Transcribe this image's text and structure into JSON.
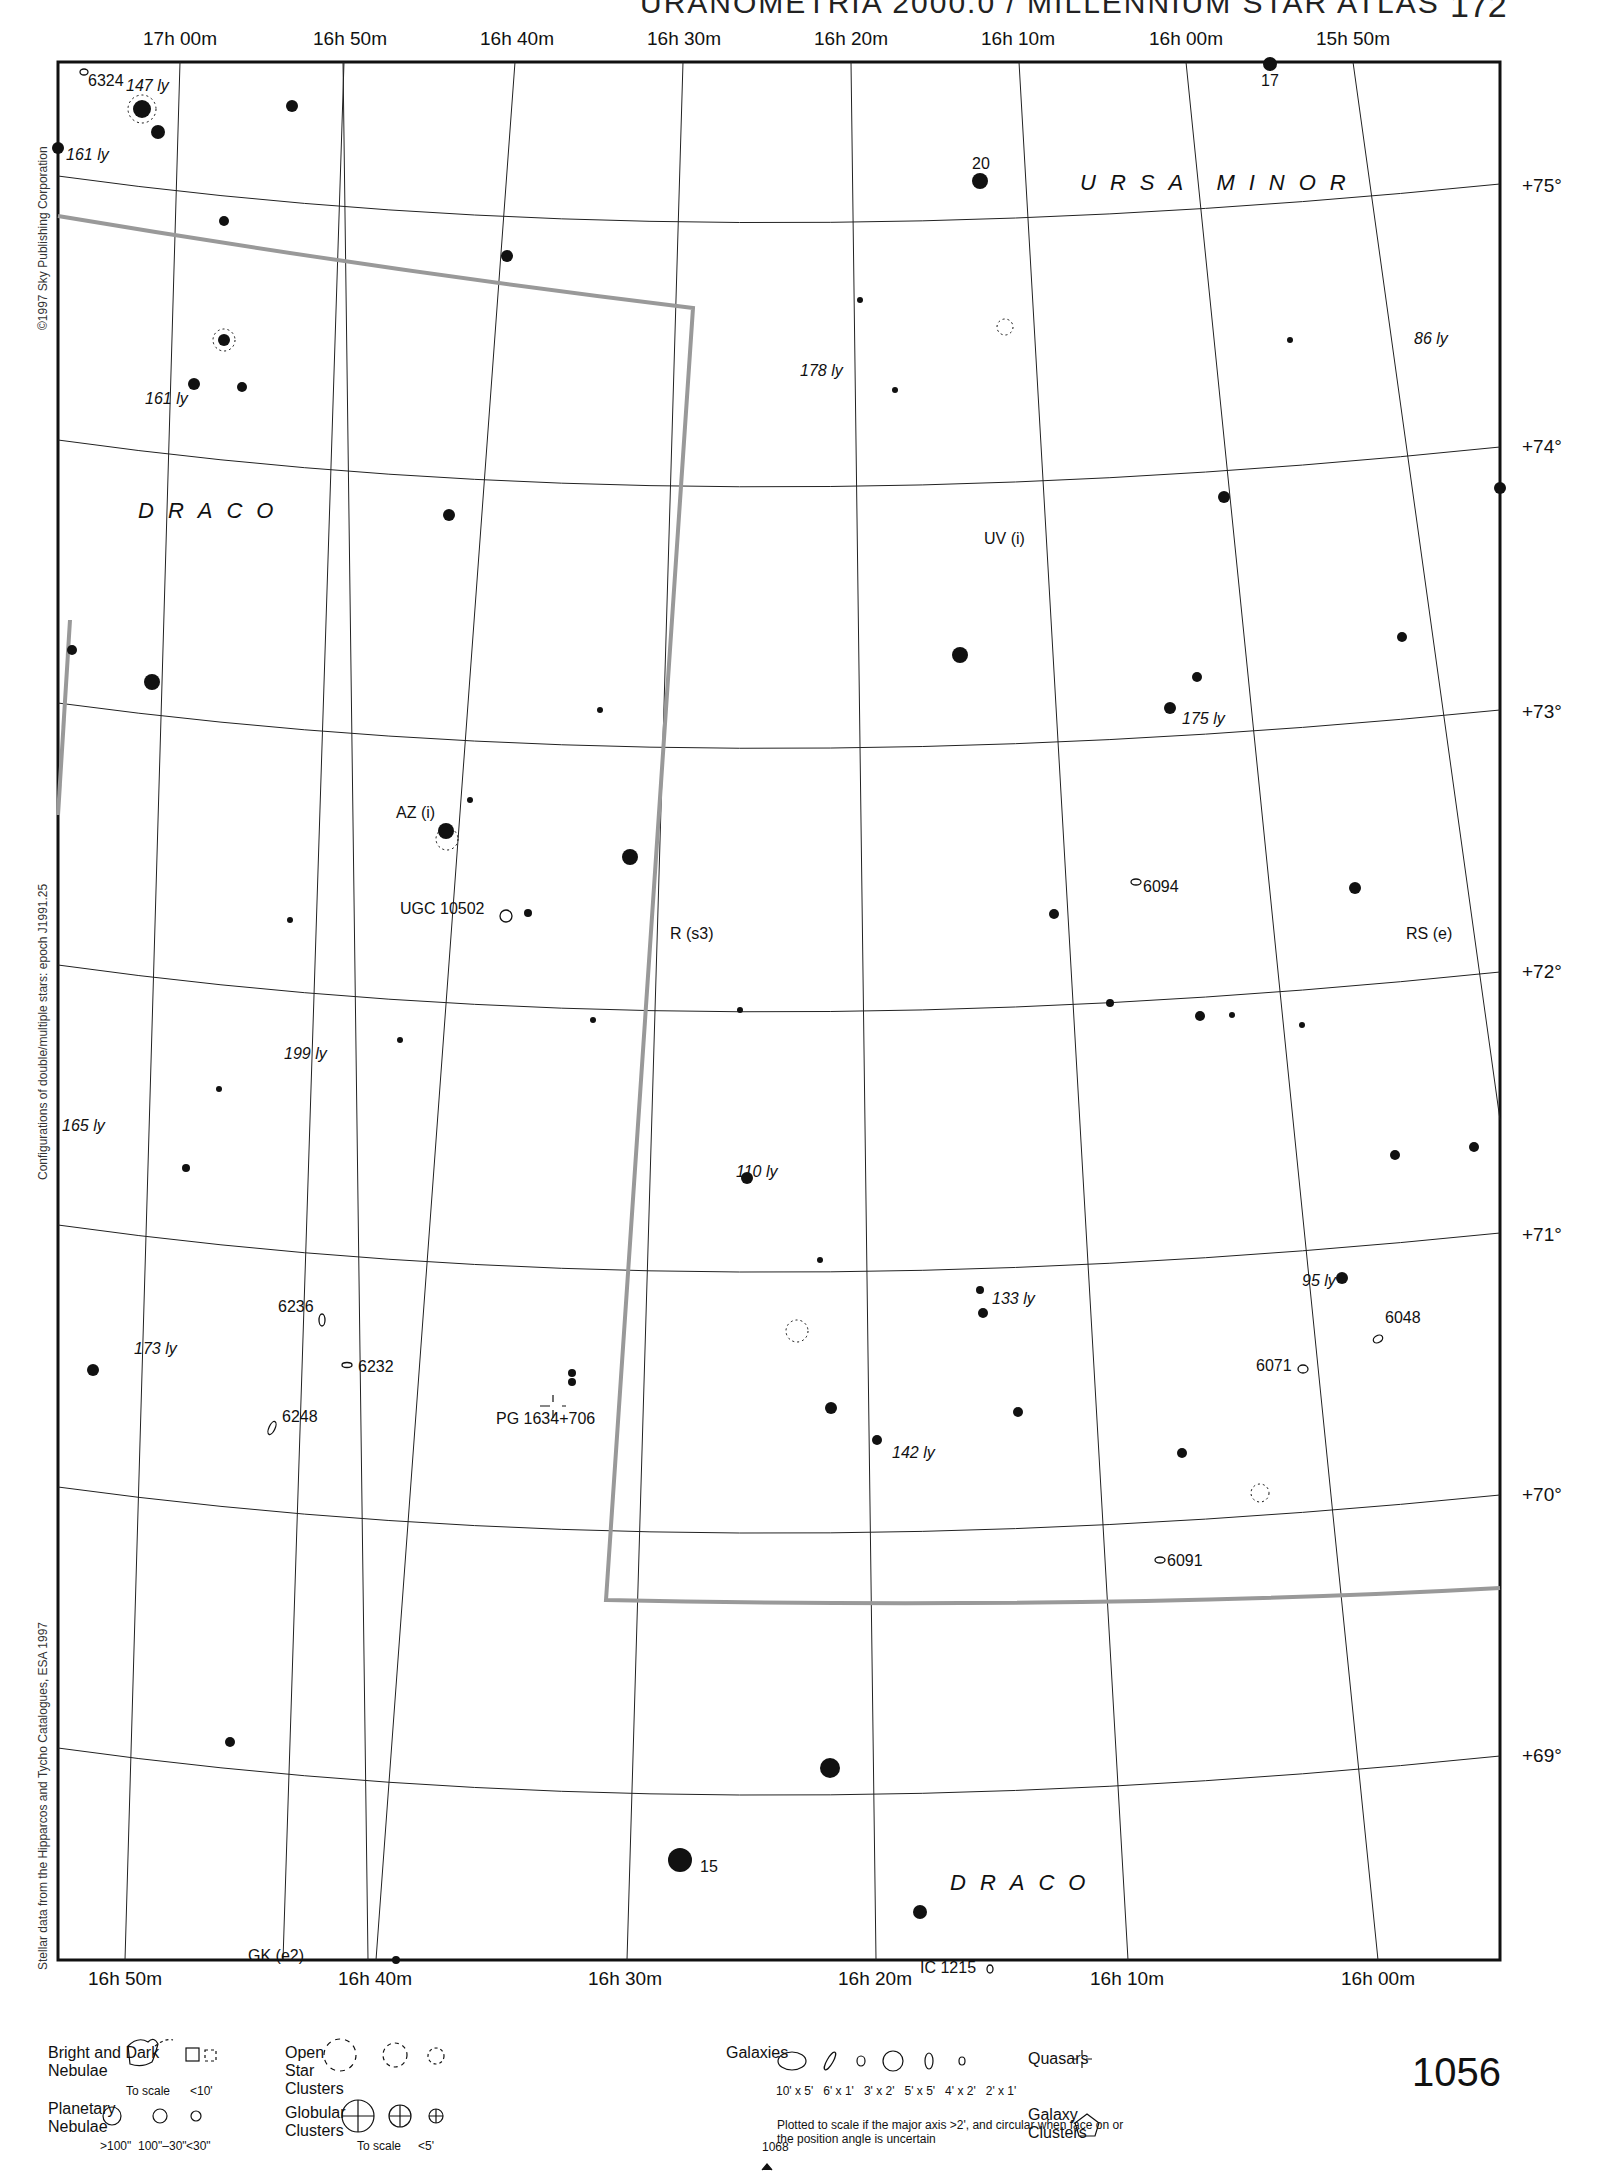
{
  "header": {
    "title": "URANOMETRIA 2000.0 / MILLENNIUM STAR ATLAS",
    "page_number": "172"
  },
  "side_texts": [
    "©1997 Sky Publishing Corporation",
    "Configurations of double/multiple stars: epoch J1991.25",
    "Stellar data from the Hipparcos and Tycho Catalogues, ESA 1997"
  ],
  "axes": {
    "ra_top": [
      "17h 00m",
      "16h 50m",
      "16h 40m",
      "16h 30m",
      "16h 20m",
      "16h 10m",
      "16h 00m",
      "15h 50m"
    ],
    "ra_bottom": [
      "16h 50m",
      "16h 40m",
      "16h 30m",
      "16h 20m",
      "16h 10m",
      "16h 00m"
    ],
    "dec_right": [
      "+75°",
      "+74°",
      "+73°",
      "+72°",
      "+71°",
      "+70°",
      "+69°"
    ]
  },
  "constellations": [
    "URSA MINOR",
    "DRACO",
    "DRACO"
  ],
  "labels": {
    "star_17": "17",
    "star_20": "20",
    "star_15": "15",
    "ngc_6324": "6324",
    "ly_147": "147 ly",
    "ly_161a": "161 ly",
    "ly_161b": "161 ly",
    "ly_178": "178 ly",
    "ly_86": "86 ly",
    "uv": "UV (i)",
    "ly_175": "175 ly",
    "az": "AZ (i)",
    "ugc": "UGC 10502",
    "r_s3": "R (s3)",
    "ngc_6094": "6094",
    "rs_e": "RS (e)",
    "ly_199": "199 ly",
    "ly_165": "165 ly",
    "ly_110": "110 ly",
    "ngc_6236": "6236",
    "ly_173": "173 ly",
    "ngc_6232": "6232",
    "ngc_6248": "6248",
    "pg": "PG 1634+706",
    "ly_133": "133 ly",
    "ly_142": "142 ly",
    "ly_95": "95 ly",
    "ngc_6048": "6048",
    "ngc_6071": "6071",
    "ngc_6091": "6091",
    "ic_1215": "IC 1215",
    "gk": "GK (e2)"
  },
  "legend": {
    "nebulae": "Bright and Dark Nebulae",
    "nebulae_scale": "To scale",
    "nebulae_small": "<10'",
    "planetary": "Planetary Nebulae",
    "pn_sizes": [
      ">100\"",
      "100\"–30\"",
      "<30\""
    ],
    "open_clusters": "Open Star Clusters",
    "globular": "Globular Clusters",
    "gc_scale": "To scale",
    "gc_small": "<5'",
    "galaxies": "Galaxies",
    "galaxy_sizes": [
      "10' x 5'",
      "6' x 1'",
      "3' x 2'",
      "5' x 5'",
      "4' x 2'",
      "2' x 1'"
    ],
    "galaxy_note": "Plotted to scale if the major axis >2', and circular when face on or the position angle is uncertain",
    "quasars": "Quasars",
    "galaxy_clusters": "Galaxy Clusters"
  },
  "chart_number": "1056",
  "adjacent_chart": "1068"
}
